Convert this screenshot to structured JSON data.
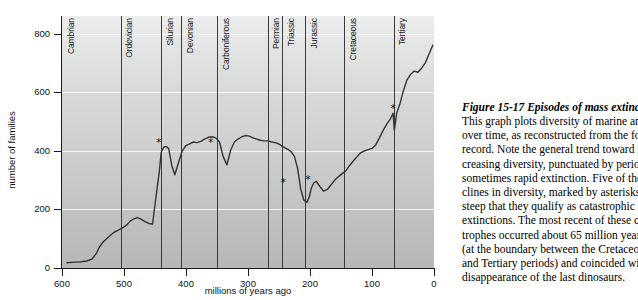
{
  "figure": {
    "caption_title": "Figure 15-17  Episodes of mass extinction.",
    "caption_lines": [
      "This graph plots diversity of marine animals",
      "over time, as reconstructed from the fossil",
      "record. Note the general trend toward in-",
      "creasing diversity, punctuated by periods of",
      "sometimes rapid extinction. Five of the de-",
      "clines in diversity, marked by asterisks, were so",
      "steep that they qualify as catastrophic mass",
      "extinctions. The most recent of these catas-",
      "trophes occurred about 65 million years ago",
      "(at the boundary between the Cretaceous",
      "and Tertiary periods) and coincided with the",
      "disappearance of the last dinosaurs."
    ]
  },
  "chart_data": {
    "type": "line",
    "title": "",
    "xlabel": "millions of years ago",
    "ylabel": "number of families",
    "xlim": [
      600,
      0
    ],
    "ylim": [
      0,
      860
    ],
    "x_reversed": true,
    "grid": "horizontal-white",
    "xticks": [
      600,
      500,
      400,
      300,
      200,
      100,
      0
    ],
    "yticks": [
      0,
      200,
      400,
      600,
      800
    ],
    "legend": "none",
    "series_name": "marine animal families",
    "x": [
      592,
      580,
      572,
      566,
      560,
      552,
      545,
      540,
      534,
      528,
      522,
      516,
      510,
      505,
      500,
      495,
      490,
      484,
      478,
      472,
      466,
      460,
      454,
      448,
      443,
      440,
      436,
      432,
      428,
      423,
      418,
      412,
      406,
      400,
      394,
      388,
      382,
      376,
      370,
      364,
      358,
      352,
      346,
      340,
      334,
      328,
      322,
      316,
      310,
      304,
      298,
      292,
      286,
      280,
      274,
      268,
      262,
      256,
      251,
      248,
      244,
      240,
      235,
      230,
      225,
      220,
      215,
      210,
      205,
      201,
      198,
      194,
      190,
      184,
      178,
      172,
      166,
      160,
      154,
      148,
      142,
      136,
      130,
      124,
      118,
      112,
      106,
      100,
      94,
      88,
      82,
      76,
      70,
      66,
      64,
      60,
      55,
      50,
      44,
      38,
      32,
      26,
      20,
      14,
      8,
      2
    ],
    "y": [
      18,
      20,
      20,
      22,
      24,
      30,
      48,
      70,
      88,
      100,
      112,
      122,
      128,
      134,
      140,
      148,
      160,
      168,
      172,
      166,
      158,
      152,
      150,
      250,
      330,
      395,
      412,
      415,
      408,
      350,
      318,
      360,
      400,
      418,
      424,
      430,
      428,
      432,
      440,
      446,
      448,
      444,
      430,
      380,
      352,
      402,
      430,
      440,
      448,
      452,
      450,
      444,
      440,
      436,
      434,
      434,
      430,
      428,
      424,
      420,
      414,
      410,
      404,
      396,
      380,
      340,
      270,
      232,
      224,
      244,
      272,
      290,
      296,
      278,
      262,
      268,
      284,
      300,
      312,
      322,
      332,
      350,
      366,
      380,
      394,
      400,
      404,
      408,
      420,
      444,
      470,
      492,
      510,
      528,
      470,
      530,
      560,
      600,
      640,
      660,
      672,
      668,
      682,
      700,
      730,
      760
    ],
    "extinction_markers": [
      {
        "label": "end-Ordovician",
        "x": 444,
        "y": 430
      },
      {
        "label": "late-Devonian",
        "x": 360,
        "y": 430
      },
      {
        "label": "end-Permian",
        "x": 243,
        "y": 295
      },
      {
        "label": "end-Triassic",
        "x": 203,
        "y": 305
      },
      {
        "label": "end-Cretaceous",
        "x": 66,
        "y": 545
      }
    ],
    "periods": [
      {
        "name": "Cambrian",
        "start": 600,
        "end": 505
      },
      {
        "name": "Ordovician",
        "start": 505,
        "end": 440
      },
      {
        "name": "Silurian",
        "start": 440,
        "end": 408
      },
      {
        "name": "Devonian",
        "start": 408,
        "end": 350
      },
      {
        "name": "Carboniferous",
        "start": 350,
        "end": 268
      },
      {
        "name": "Permian",
        "start": 268,
        "end": 245
      },
      {
        "name": "Triassic",
        "start": 245,
        "end": 208
      },
      {
        "name": "Jurassic",
        "start": 208,
        "end": 145
      },
      {
        "name": "Cretaceous",
        "start": 145,
        "end": 65
      },
      {
        "name": "Tertiary",
        "start": 65,
        "end": 0
      }
    ]
  }
}
